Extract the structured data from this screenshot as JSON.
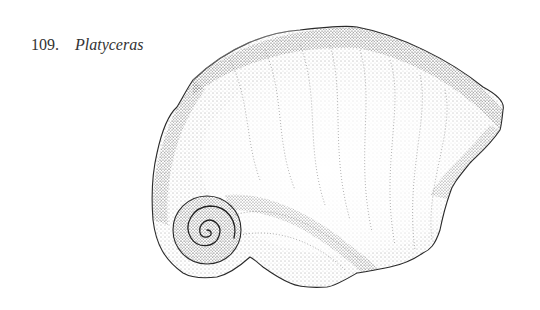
{
  "figure": {
    "number": "109.",
    "name": "Platyceras",
    "style": "stippled-pen-drawing",
    "colors": {
      "ink": "#2a2a2a",
      "background": "#ffffff"
    }
  }
}
